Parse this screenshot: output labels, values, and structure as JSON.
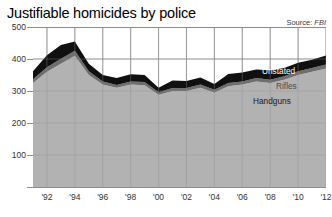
{
  "chart_data": {
    "type": "area",
    "title": "Justifiable homicides by police",
    "source_label": "Source:",
    "source_value": "FBI",
    "xlabel": "",
    "ylabel": "",
    "ylim": [
      0,
      500
    ],
    "xlim": [
      1991,
      2012
    ],
    "grid": true,
    "stacked": true,
    "legend_position": "inline-right",
    "yticks": [
      100,
      200,
      300,
      400,
      500
    ],
    "ytick_labels": [
      "100",
      "200",
      "300",
      "400",
      "500"
    ],
    "x": [
      1991,
      1992,
      1993,
      1994,
      1995,
      1996,
      1997,
      1998,
      1999,
      2000,
      2001,
      2002,
      2003,
      2004,
      2005,
      2006,
      2007,
      2008,
      2009,
      2010,
      2011,
      2012
    ],
    "xtick_values": [
      1992,
      1994,
      1996,
      1998,
      2000,
      2002,
      2004,
      2006,
      2008,
      2010,
      2012
    ],
    "xtick_labels": [
      "'92",
      "'94",
      "'96",
      "'98",
      "'00",
      "'02",
      "'04",
      "'06",
      "'08",
      "'10",
      "'12"
    ],
    "series": [
      {
        "name": "Handguns",
        "color": "#b2b2b2",
        "values": [
          325,
          360,
          385,
          410,
          350,
          320,
          310,
          320,
          318,
          288,
          300,
          300,
          310,
          295,
          315,
          320,
          330,
          325,
          335,
          350,
          360,
          370
        ]
      },
      {
        "name": "Rifles",
        "color": "#6e6e6e",
        "values": [
          12,
          14,
          16,
          16,
          12,
          10,
          9,
          10,
          10,
          8,
          9,
          9,
          10,
          9,
          10,
          10,
          11,
          10,
          11,
          12,
          12,
          13
        ]
      },
      {
        "name": "Unstated",
        "color": "#101010",
        "values": [
          25,
          38,
          43,
          29,
          23,
          20,
          22,
          22,
          22,
          14,
          24,
          22,
          22,
          18,
          28,
          28,
          26,
          30,
          26,
          26,
          26,
          28
        ]
      }
    ],
    "totals": [
      362,
      412,
      444,
      455,
      385,
      350,
      341,
      352,
      350,
      310,
      333,
      331,
      342,
      322,
      353,
      358,
      367,
      365,
      372,
      388,
      398,
      411
    ],
    "inline_labels": [
      {
        "text": "Unstated",
        "series": "Unstated"
      },
      {
        "text": "Rifles",
        "series": "Rifles"
      },
      {
        "text": "Handguns",
        "series": "Handguns"
      }
    ]
  }
}
